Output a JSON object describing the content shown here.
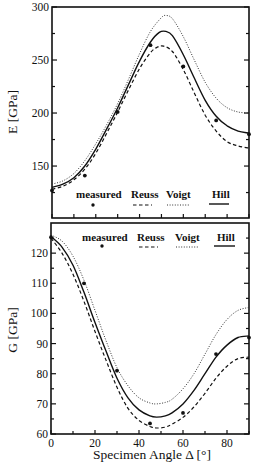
{
  "chart_data": [
    {
      "type": "line",
      "panel": "top",
      "title": "",
      "xlabel": "",
      "ylabel": "E [GPa]",
      "xlim": [
        0,
        90
      ],
      "ylim": [
        101,
        300
      ],
      "yticks": [
        150,
        200,
        250,
        300
      ],
      "yticks_minor": [
        125,
        175,
        225,
        275
      ],
      "xticks": [
        0,
        10,
        20,
        30,
        40,
        50,
        60,
        70,
        80,
        90
      ],
      "show_xtick_labels": false,
      "grid": false,
      "legend": {
        "position": "bottom-inside",
        "entries": [
          {
            "label": "measured",
            "style": "point"
          },
          {
            "label": "Reuss",
            "style": "dashed"
          },
          {
            "label": "Voigt",
            "style": "dotted"
          },
          {
            "label": "Hill",
            "style": "solid"
          }
        ]
      },
      "series": [
        {
          "name": "Voigt",
          "style": "dotted",
          "x": [
            0,
            5,
            10,
            15,
            20,
            25,
            30,
            35,
            40,
            45,
            50,
            52,
            55,
            60,
            65,
            70,
            75,
            80,
            85,
            90
          ],
          "y": [
            133,
            136,
            143,
            155,
            171,
            189,
            209,
            232,
            256,
            277,
            290,
            292,
            289,
            272,
            250,
            229,
            214,
            205,
            201,
            200
          ]
        },
        {
          "name": "Hill",
          "style": "solid",
          "x": [
            0,
            5,
            10,
            15,
            20,
            25,
            30,
            35,
            40,
            45,
            49,
            52,
            55,
            60,
            65,
            70,
            75,
            80,
            85,
            90
          ],
          "y": [
            130,
            133,
            139,
            150,
            166,
            185,
            205,
            227,
            249,
            267,
            276,
            277,
            273,
            255,
            233,
            212,
            197,
            188,
            183,
            181
          ]
        },
        {
          "name": "Reuss",
          "style": "dashed",
          "x": [
            0,
            5,
            10,
            15,
            20,
            25,
            30,
            35,
            40,
            45,
            48,
            51,
            55,
            60,
            65,
            70,
            75,
            80,
            85,
            90
          ],
          "y": [
            128,
            131,
            137,
            147,
            162,
            181,
            201,
            222,
            242,
            257,
            262,
            263,
            258,
            241,
            219,
            198,
            183,
            173,
            169,
            167
          ]
        },
        {
          "name": "measured",
          "style": "point",
          "x": [
            0,
            15,
            30,
            45,
            60,
            75,
            90
          ],
          "y": [
            127,
            141,
            201,
            264,
            244,
            193,
            180
          ]
        }
      ]
    },
    {
      "type": "line",
      "panel": "bottom",
      "title": "",
      "xlabel": "Specimen Angle Δ [°]",
      "ylabel": "G [GPa]",
      "xlim": [
        0,
        90
      ],
      "ylim": [
        60,
        130
      ],
      "yticks": [
        60,
        70,
        80,
        90,
        100,
        110,
        120
      ],
      "yticks_minor": [
        65,
        75,
        85,
        95,
        105,
        115,
        125
      ],
      "xticks": [
        0,
        20,
        40,
        60,
        80
      ],
      "xticks_minor": [
        10,
        30,
        50,
        70,
        90
      ],
      "show_xtick_labels": true,
      "grid": false,
      "legend": {
        "position": "top-inside",
        "entries": [
          {
            "label": "measured",
            "style": "point"
          },
          {
            "label": "Reuss",
            "style": "dashed"
          },
          {
            "label": "Voigt",
            "style": "dotted"
          },
          {
            "label": "Hill",
            "style": "solid"
          }
        ]
      },
      "series": [
        {
          "name": "Voigt",
          "style": "dotted",
          "x": [
            0,
            5,
            10,
            15,
            20,
            25,
            30,
            35,
            40,
            45,
            48,
            52,
            55,
            60,
            65,
            70,
            75,
            80,
            85,
            90
          ],
          "y": [
            126,
            124,
            119,
            111,
            101,
            91,
            82,
            76,
            72,
            70.3,
            70,
            70.5,
            71.5,
            75,
            80,
            86.5,
            93,
            98,
            101,
            102
          ]
        },
        {
          "name": "Hill",
          "style": "solid",
          "x": [
            0,
            5,
            10,
            15,
            20,
            25,
            30,
            35,
            40,
            45,
            48,
            52,
            55,
            60,
            65,
            70,
            75,
            80,
            85,
            90
          ],
          "y": [
            125.5,
            122,
            116,
            107,
            97,
            87.5,
            78.5,
            72,
            68,
            66,
            65.6,
            66,
            67,
            70,
            74.5,
            80,
            85.5,
            89.5,
            92,
            92.5
          ]
        },
        {
          "name": "Reuss",
          "style": "dashed",
          "x": [
            0,
            5,
            10,
            15,
            20,
            25,
            30,
            35,
            40,
            45,
            48,
            52,
            55,
            60,
            65,
            70,
            75,
            80,
            85,
            90
          ],
          "y": [
            125,
            120,
            113,
            104,
            94,
            84.5,
            75.5,
            68.5,
            64.5,
            62.5,
            62,
            62.3,
            63.3,
            65.5,
            69,
            73.5,
            78.5,
            82.5,
            85,
            85.5
          ]
        },
        {
          "name": "measured",
          "style": "point",
          "x": [
            0,
            15,
            30,
            45,
            60,
            75,
            90
          ],
          "y": [
            125.3,
            110,
            81,
            63.5,
            67,
            86.5,
            92
          ]
        }
      ]
    }
  ]
}
